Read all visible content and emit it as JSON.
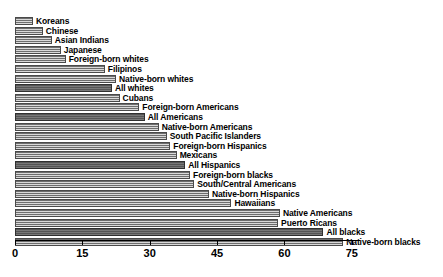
{
  "chart_data": {
    "type": "bar",
    "orientation": "horizontal",
    "title": "",
    "subtitle": "",
    "xlabel": "",
    "ylabel": "",
    "xlim": [
      0,
      78
    ],
    "ylim": null,
    "grid": false,
    "legend": null,
    "ticks": [
      0,
      15,
      30,
      45,
      60,
      75
    ],
    "tick_labels": [
      "0",
      "15",
      "30",
      "45",
      "60",
      "75"
    ],
    "categories": [
      "Koreans",
      "Chinese",
      "Asian Indians",
      "Japanese",
      "Foreign-born whites",
      "Filipinos",
      "Native-born whites",
      "All whites",
      "Cubans",
      "Foreign-born Americans",
      "All Americans",
      "Native-born Americans",
      "South Pacific Islanders",
      "Foreign-born Hispanics",
      "Mexicans",
      "All Hispanics",
      "Foreign-born blacks",
      "South/Central Americans",
      "Native-born Hispanics",
      "Hawaiians",
      "Native Americans",
      "Puerto Ricans",
      "All blacks",
      "Native-born blacks"
    ],
    "values": [
      4.0,
      6.2,
      8.2,
      10.2,
      11.3,
      20.0,
      22.5,
      21.6,
      23.3,
      27.7,
      28.9,
      32.0,
      33.8,
      34.6,
      36.0,
      37.9,
      39.0,
      39.9,
      43.2,
      48.2,
      59.0,
      58.6,
      68.7,
      73.1
    ],
    "highlighted": [
      "All whites",
      "All Americans",
      "All Hispanics",
      "All blacks"
    ],
    "colors": {
      "bar_fill": "#b9b9b9",
      "bar_hatch": "#6e6e6e",
      "bar_edge": "#4a4a4a",
      "bar_highlight_fill": "#6a6a6a",
      "axis": "#000000",
      "background": "#ffffff",
      "text": "#000000"
    }
  },
  "bars": [
    {
      "label": "Koreans",
      "value": 4.0,
      "highlight": false
    },
    {
      "label": "Chinese",
      "value": 6.2,
      "highlight": false
    },
    {
      "label": "Asian Indians",
      "value": 8.2,
      "highlight": false
    },
    {
      "label": "Japanese",
      "value": 10.2,
      "highlight": false
    },
    {
      "label": "Foreign-born whites",
      "value": 11.3,
      "highlight": false
    },
    {
      "label": "Filipinos",
      "value": 20.0,
      "highlight": false
    },
    {
      "label": "Native-born whites",
      "value": 22.5,
      "highlight": false
    },
    {
      "label": "All whites",
      "value": 21.6,
      "highlight": true
    },
    {
      "label": "Cubans",
      "value": 23.3,
      "highlight": false
    },
    {
      "label": "Foreign-born Americans",
      "value": 27.7,
      "highlight": false
    },
    {
      "label": "All Americans",
      "value": 28.9,
      "highlight": true
    },
    {
      "label": "Native-born Americans",
      "value": 32.0,
      "highlight": false
    },
    {
      "label": "South Pacific Islanders",
      "value": 33.8,
      "highlight": false
    },
    {
      "label": "Foreign-born Hispanics",
      "value": 34.6,
      "highlight": false
    },
    {
      "label": "Mexicans",
      "value": 36.0,
      "highlight": false
    },
    {
      "label": "All Hispanics",
      "value": 37.9,
      "highlight": true
    },
    {
      "label": "Foreign-born blacks",
      "value": 39.0,
      "highlight": false
    },
    {
      "label": "South/Central Americans",
      "value": 39.9,
      "highlight": false
    },
    {
      "label": "Native-born Hispanics",
      "value": 43.2,
      "highlight": false
    },
    {
      "label": "Hawaiians",
      "value": 48.2,
      "highlight": false
    },
    {
      "label": "Native Americans",
      "value": 59.0,
      "highlight": false
    },
    {
      "label": "Puerto Ricans",
      "value": 58.6,
      "highlight": false
    },
    {
      "label": "All blacks",
      "value": 68.7,
      "highlight": true
    },
    {
      "label": "Native-born blacks",
      "value": 73.1,
      "highlight": false
    }
  ]
}
